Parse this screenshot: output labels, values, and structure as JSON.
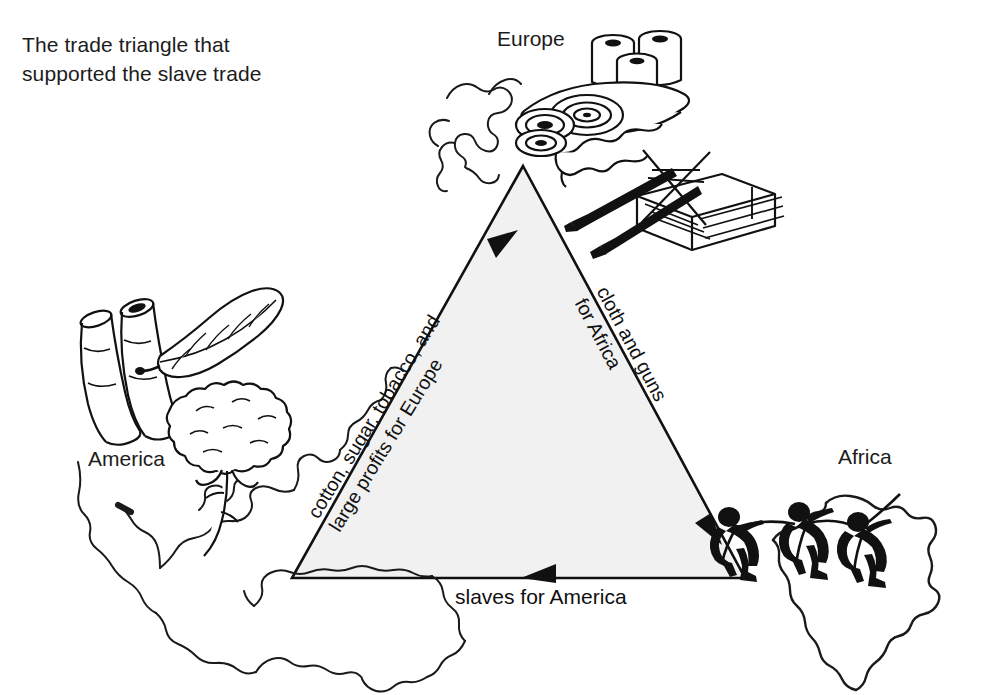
{
  "caption": {
    "text": "The trade triangle that supported the slave trade"
  },
  "diagram": {
    "type": "triangular-trade-diagram",
    "triangle": {
      "fill": "#f1f1f1",
      "stroke": "#111111",
      "vertices": {
        "europe_apex": [
          523,
          166
        ],
        "america_bottom_left": [
          292,
          578
        ],
        "africa_bottom_right": [
          745,
          578
        ]
      }
    },
    "regions": [
      {
        "name": "europe",
        "label": "Europe"
      },
      {
        "name": "america",
        "label": "America"
      },
      {
        "name": "africa",
        "label": "Africa"
      }
    ],
    "edges": [
      {
        "name": "america-to-europe",
        "from": "America",
        "to": "Europe",
        "direction": "up-right",
        "label_lines": [
          "cotton, sugar, tobacco, and",
          "large profits for Europe"
        ]
      },
      {
        "name": "europe-to-africa",
        "from": "Europe",
        "to": "Africa",
        "direction": "down-right",
        "label_lines": [
          "cloth and guns",
          "for Africa"
        ]
      },
      {
        "name": "africa-to-america",
        "from": "Africa",
        "to": "America",
        "direction": "left",
        "label_lines": [
          "slaves for America"
        ]
      }
    ],
    "illustrations": [
      {
        "name": "cloth-rolls-illustration",
        "region": "europe",
        "depicts": "rolls and bolts of cloth"
      },
      {
        "name": "muskets-and-crate-illustration",
        "region": "europe",
        "depicts": "guns resting on a wooden crate"
      },
      {
        "name": "sugar-cane-illustration",
        "region": "america",
        "depicts": "cut sugar cane stalks"
      },
      {
        "name": "tobacco-leaf-illustration",
        "region": "america",
        "depicts": "tobacco leaf"
      },
      {
        "name": "cotton-boll-illustration",
        "region": "america",
        "depicts": "cotton boll on stem"
      },
      {
        "name": "enslaved-people-illustration",
        "region": "africa",
        "depicts": "three chained enslaved people walking"
      },
      {
        "name": "europe-map-outline",
        "region": "europe",
        "depicts": "outline map of Europe"
      },
      {
        "name": "americas-map-outline",
        "region": "america",
        "depicts": "outline map of North and South America"
      },
      {
        "name": "africa-map-outline",
        "region": "africa",
        "depicts": "outline map of Africa"
      }
    ]
  }
}
